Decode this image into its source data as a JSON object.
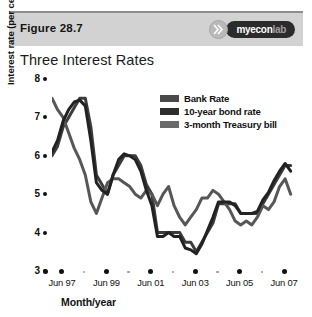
{
  "figure": {
    "label": "Figure 28.7",
    "title": "Three Interest Rates"
  },
  "logo": {
    "name": "myeconlab-logo",
    "part1": "my",
    "part2": "econ",
    "part3": "lab",
    "badge_icon": "double-chevron-icon"
  },
  "chart_data": {
    "type": "line",
    "title": "Three Interest Rates",
    "xlabel": "Month/year",
    "ylabel": "Interest rate (per cent per year)",
    "ylim": [
      3,
      8
    ],
    "yticks": [
      8,
      7,
      6,
      5,
      4,
      3
    ],
    "xlim": [
      1997.0,
      2007.9
    ],
    "xticks": [
      1997.45,
      1999.45,
      2001.45,
      2003.45,
      2005.45,
      2007.45
    ],
    "xticklabels": [
      "Jun 97",
      "Jun 99",
      "Jun 01",
      "Jun 03",
      "Jun 05",
      "Jun 07"
    ],
    "xminor": [
      1998.45,
      2000.45,
      2002.45,
      2004.45,
      2006.45
    ],
    "grid": false,
    "legend_position": "top-right",
    "series": [
      {
        "name": "Bank Rate",
        "color": "#3c3c3c",
        "x": [
          1997.0,
          1997.25,
          1997.5,
          1997.75,
          1998.0,
          1998.25,
          1998.5,
          1998.75,
          1999.0,
          1999.25,
          1999.5,
          1999.75,
          2000.0,
          2000.25,
          2000.5,
          2000.75,
          2001.0,
          2001.25,
          2001.5,
          2001.75,
          2002.0,
          2002.25,
          2002.5,
          2002.75,
          2003.0,
          2003.25,
          2003.5,
          2003.75,
          2004.0,
          2004.25,
          2004.5,
          2004.75,
          2005.0,
          2005.25,
          2005.5,
          2005.75,
          2006.0,
          2006.25,
          2006.5,
          2006.75,
          2007.0,
          2007.25,
          2007.5,
          2007.75
        ],
        "values": [
          6.0,
          6.25,
          6.75,
          7.0,
          7.25,
          7.5,
          7.5,
          6.75,
          5.5,
          5.25,
          5.0,
          5.5,
          5.75,
          6.0,
          6.0,
          6.0,
          5.75,
          5.25,
          5.0,
          4.0,
          4.0,
          4.0,
          4.0,
          4.0,
          3.75,
          3.75,
          3.5,
          3.75,
          4.0,
          4.25,
          4.75,
          4.75,
          4.75,
          4.75,
          4.5,
          4.5,
          4.5,
          4.5,
          4.75,
          5.0,
          5.25,
          5.5,
          5.75,
          5.75
        ]
      },
      {
        "name": "10-year bond rate",
        "color": "#575757",
        "x": [
          1997.0,
          1997.25,
          1997.5,
          1997.75,
          1998.0,
          1998.25,
          1998.5,
          1998.75,
          1999.0,
          1999.25,
          1999.5,
          1999.75,
          2000.0,
          2000.25,
          2000.5,
          2000.75,
          2001.0,
          2001.25,
          2001.5,
          2001.75,
          2002.0,
          2002.25,
          2002.5,
          2002.75,
          2003.0,
          2003.25,
          2003.5,
          2003.75,
          2004.0,
          2004.25,
          2004.5,
          2004.75,
          2005.0,
          2005.25,
          2005.5,
          2005.75,
          2006.0,
          2006.25,
          2006.5,
          2006.75,
          2007.0,
          2007.25,
          2007.5,
          2007.75
        ],
        "values": [
          7.5,
          7.2,
          7.0,
          6.6,
          6.2,
          5.9,
          5.5,
          4.8,
          4.5,
          4.9,
          5.3,
          5.4,
          5.4,
          5.3,
          5.2,
          5.0,
          4.9,
          5.1,
          5.0,
          4.7,
          5.0,
          5.2,
          4.7,
          4.4,
          4.2,
          4.4,
          4.6,
          4.9,
          4.9,
          5.1,
          5.0,
          4.8,
          4.6,
          4.3,
          4.2,
          4.3,
          4.2,
          4.4,
          4.7,
          4.6,
          4.8,
          5.2,
          5.4,
          5.0
        ]
      },
      {
        "name": "3-month Treasury bill",
        "color": "#222222",
        "x": [
          1997.0,
          1997.25,
          1997.5,
          1997.75,
          1998.0,
          1998.25,
          1998.5,
          1998.75,
          1999.0,
          1999.25,
          1999.5,
          1999.75,
          2000.0,
          2000.25,
          2000.5,
          2000.75,
          2001.0,
          2001.25,
          2001.5,
          2001.75,
          2002.0,
          2002.25,
          2002.5,
          2002.75,
          2003.0,
          2003.25,
          2003.5,
          2003.75,
          2004.0,
          2004.25,
          2004.5,
          2004.75,
          2005.0,
          2005.25,
          2005.5,
          2005.75,
          2006.0,
          2006.25,
          2006.5,
          2006.75,
          2007.0,
          2007.25,
          2007.5,
          2007.75
        ],
        "values": [
          6.1,
          6.4,
          6.9,
          7.2,
          7.4,
          7.45,
          7.3,
          6.4,
          5.3,
          5.1,
          5.0,
          5.5,
          5.9,
          6.05,
          6.0,
          5.9,
          5.6,
          5.1,
          4.7,
          3.9,
          3.9,
          4.0,
          3.9,
          3.9,
          3.6,
          3.55,
          3.45,
          3.7,
          4.05,
          4.4,
          4.8,
          4.8,
          4.8,
          4.7,
          4.5,
          4.5,
          4.5,
          4.55,
          4.85,
          5.05,
          5.35,
          5.6,
          5.8,
          5.6
        ]
      }
    ]
  },
  "legend": {
    "items": [
      {
        "label": "Bank Rate",
        "color": "#4a4a4a"
      },
      {
        "label": "10-year bond rate",
        "color": "#2e2e2e"
      },
      {
        "label": "3-month Treasury bill",
        "color": "#6a6a6a"
      }
    ]
  }
}
